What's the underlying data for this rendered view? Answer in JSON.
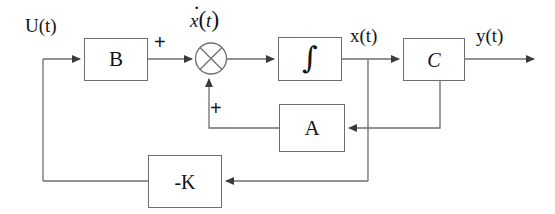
{
  "diagram": {
    "background_color": "#ffffff",
    "line_color": "#6e6e6e",
    "text_color": "#141414"
  },
  "labels": {
    "input": "U(t)",
    "state_derivative_var": "x",
    "state_derivative_open": "(",
    "state_derivative_arg": "t",
    "state_derivative_close": ")",
    "state": "x(t)",
    "output": "y(t)",
    "plus_top": "+",
    "plus_bottom": "+"
  },
  "blocks": [
    {
      "id": "B",
      "label": "B",
      "name": "input-matrix-block"
    },
    {
      "id": "INT",
      "label": "∫",
      "name": "integrator-block"
    },
    {
      "id": "C",
      "label": "C",
      "name": "output-matrix-block"
    },
    {
      "id": "A",
      "label": "A",
      "name": "state-matrix-block"
    },
    {
      "id": "K",
      "label": "-K",
      "name": "feedback-gain-block"
    }
  ],
  "summing_junction": {
    "name": "summing-junction",
    "style": "circle-with-cross",
    "inputs": [
      "+",
      "+"
    ]
  },
  "signals": [
    {
      "from": "U(t)",
      "to": "B",
      "name": "input-signal"
    },
    {
      "from": "B",
      "to": "sum",
      "name": "b-to-sum-signal",
      "sign": "+"
    },
    {
      "from": "sum",
      "to": "INT",
      "name": "xdot-signal"
    },
    {
      "from": "INT",
      "to": "C",
      "name": "state-signal"
    },
    {
      "from": "C",
      "to": "y(t)",
      "name": "output-signal"
    },
    {
      "from": "x(t)",
      "to": "A",
      "name": "state-feedback-to-a"
    },
    {
      "from": "A",
      "to": "sum",
      "name": "a-to-sum-signal",
      "sign": "+"
    },
    {
      "from": "x(t)",
      "to": "K",
      "name": "state-feedback-to-k"
    },
    {
      "from": "K",
      "to": "input-line",
      "name": "k-to-input-signal"
    }
  ]
}
